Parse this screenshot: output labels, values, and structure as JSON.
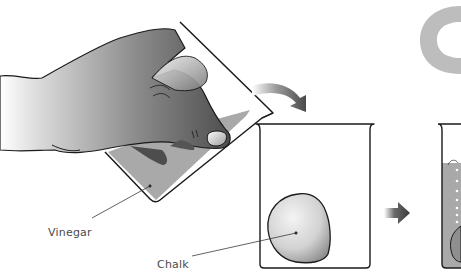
{
  "diagram": {
    "step_letter": "C",
    "labels": {
      "vinegar": "Vinegar",
      "chalk": "Chalk"
    },
    "steps": [
      {
        "name": "pour-vinegar",
        "elements": [
          "hand",
          "tilted-beaker",
          "vinegar"
        ]
      },
      {
        "name": "chalk-in-beaker",
        "elements": [
          "beaker",
          "chalk"
        ]
      },
      {
        "name": "reaction",
        "elements": [
          "beaker",
          "vinegar",
          "bubbles",
          "chalk"
        ]
      }
    ],
    "arrows": [
      {
        "type": "curved",
        "direction": "down-right"
      },
      {
        "type": "straight",
        "direction": "right"
      }
    ],
    "colors": {
      "liquid": "#a9a9a9",
      "outline": "#1a1a1a",
      "hand_dark": "#5a5a5a",
      "arrow": "#4a4a4a",
      "letter": "#bdbdbd"
    }
  }
}
